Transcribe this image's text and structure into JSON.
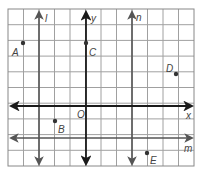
{
  "diagram": {
    "type": "coordinate-grid",
    "grid": {
      "columns": 12,
      "rows": 10,
      "origin_px": [
        8,
        9
      ],
      "cell_w": 15.5,
      "cell_h": 15.7,
      "line_color": "#9a9a9a",
      "border_color": "#7a7a7a"
    },
    "axes": {
      "x_label": "x",
      "y_label": "y",
      "origin_label": "O",
      "color": "#1a1a1a"
    },
    "lines": [
      {
        "name": "l",
        "orientation": "vertical",
        "col": 2
      },
      {
        "name": "n",
        "orientation": "vertical",
        "col": 8
      },
      {
        "name": "m",
        "orientation": "horizontal",
        "row": 8
      }
    ],
    "points": [
      {
        "label": "A",
        "x": 23,
        "y": 43
      },
      {
        "label": "C",
        "x": 86,
        "y": 43
      },
      {
        "label": "D",
        "x": 176,
        "y": 74
      },
      {
        "label": "B",
        "x": 55,
        "y": 121
      },
      {
        "label": "E",
        "x": 147,
        "y": 153
      }
    ],
    "labels": {
      "l": "l",
      "y": "y",
      "n": "n",
      "A": "A",
      "C": "C",
      "D": "D",
      "O": "O",
      "x": "x",
      "B": "B",
      "m": "m",
      "E": "E"
    }
  }
}
